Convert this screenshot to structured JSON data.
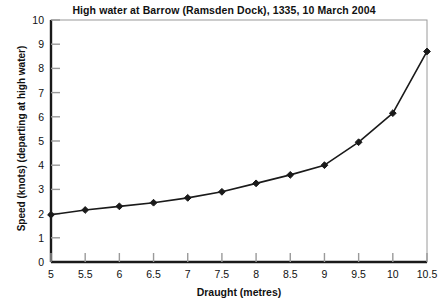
{
  "chart_data": {
    "type": "line",
    "title": "High water at Barrow (Ramsden Dock), 1335, 10 March 2004",
    "xlabel": "Draught (metres)",
    "ylabel": "Speed (knots) (departing at high water)",
    "x": [
      5,
      5.5,
      6,
      6.5,
      7,
      7.5,
      8,
      8.5,
      9,
      9.5,
      10,
      10.5
    ],
    "values": [
      1.95,
      2.15,
      2.3,
      2.45,
      2.65,
      2.9,
      3.25,
      3.6,
      4.0,
      4.95,
      6.15,
      8.7
    ],
    "xlim": [
      5,
      10.5
    ],
    "ylim": [
      0,
      10
    ],
    "xticks": [
      5,
      5.5,
      6,
      6.5,
      7,
      7.5,
      8,
      8.5,
      9,
      9.5,
      10,
      10.5
    ],
    "xtick_labels": [
      "5",
      "5.5",
      "6",
      "6.5",
      "7",
      "7.5",
      "8",
      "8.5",
      "9",
      "9.5",
      "10",
      "10.5"
    ],
    "yticks": [
      0,
      1,
      2,
      3,
      4,
      5,
      6,
      7,
      8,
      9,
      10
    ],
    "ytick_labels": [
      "0",
      "1",
      "2",
      "3",
      "4",
      "5",
      "6",
      "7",
      "8",
      "9",
      "10"
    ],
    "grid": false,
    "legend": null,
    "marker": "diamond",
    "line_color": "#1a1a1a",
    "marker_color": "#1a1a1a",
    "background_color": "#ffffff",
    "axis_color": "#1a1a1a",
    "frame_color": "#9a9a9a"
  }
}
